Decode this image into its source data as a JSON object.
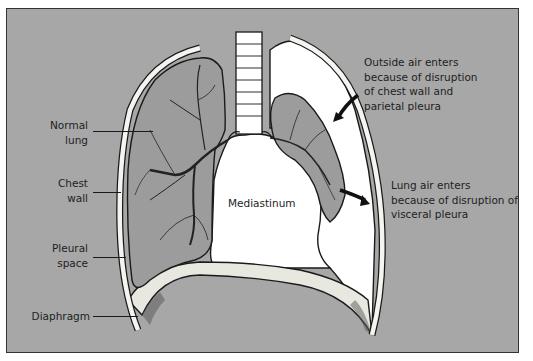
{
  "figure": {
    "colors": {
      "background": "#a7a7a7",
      "frame": "#333333",
      "lung": "#999999",
      "air_space": "#ffffff",
      "outline": "#1a1a1a"
    }
  },
  "labels": {
    "normal_lung": {
      "line1": "Normal",
      "line2": "lung"
    },
    "chest_wall": {
      "line1": "Chest",
      "line2": "wall"
    },
    "pleural_space": {
      "line1": "Pleural",
      "line2": "space"
    },
    "diaphragm": {
      "line1": "Diaphragm"
    },
    "mediastinum": {
      "line1": "Mediastinum"
    },
    "outside_air": {
      "line1": "Outside air enters",
      "line2": "because of disruption",
      "line3": "of chest wall and",
      "line4": "parietal pleura"
    },
    "lung_air": {
      "line1": "Lung air enters",
      "line2": "because of disruption of",
      "line3": "visceral pleura"
    }
  }
}
